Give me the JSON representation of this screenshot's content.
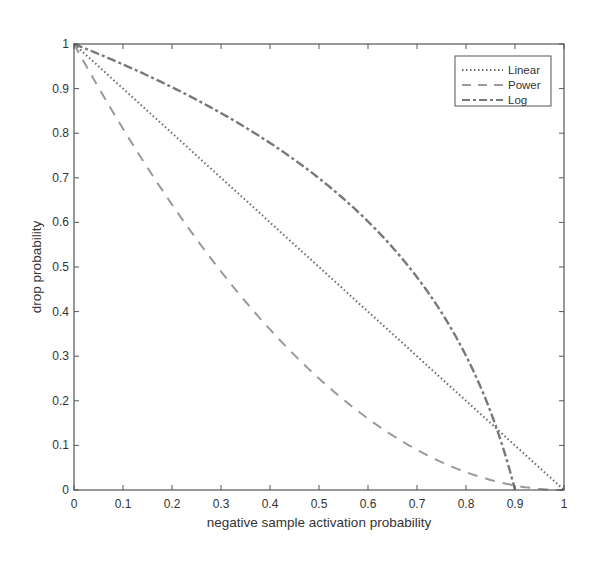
{
  "chart_data": {
    "type": "line",
    "title": "",
    "xlabel": "negative sample activation probability",
    "ylabel": "drop probability",
    "xlim": [
      0,
      1
    ],
    "ylim": [
      0,
      1
    ],
    "grid": false,
    "legend_position": "upper right",
    "xticks": [
      "0",
      "0.1",
      "0.2",
      "0.3",
      "0.4",
      "0.5",
      "0.6",
      "0.7",
      "0.8",
      "0.9",
      "1"
    ],
    "yticks": [
      "0",
      "0.1",
      "0.2",
      "0.3",
      "0.4",
      "0.5",
      "0.6",
      "0.7",
      "0.8",
      "0.9",
      "1"
    ],
    "x": [
      0,
      0.1,
      0.2,
      0.3,
      0.4,
      0.5,
      0.6,
      0.7,
      0.8,
      0.85,
      0.9,
      1.0
    ],
    "series": [
      {
        "name": "Linear",
        "style": "dotted",
        "color": "#6a6a6a",
        "values": [
          1.0,
          0.9,
          0.8,
          0.7,
          0.6,
          0.5,
          0.4,
          0.3,
          0.2,
          0.15,
          0.1,
          0.0
        ]
      },
      {
        "name": "Power",
        "style": "dashed",
        "color": "#9a9a9a",
        "values": [
          1.0,
          0.81,
          0.64,
          0.49,
          0.36,
          0.25,
          0.16,
          0.09,
          0.04,
          0.0225,
          0.01,
          0.0
        ]
      },
      {
        "name": "Log",
        "style": "dash-dot",
        "color": "#787878",
        "values": [
          1.0,
          0.954,
          0.903,
          0.845,
          0.778,
          0.699,
          0.602,
          0.477,
          0.301,
          0.176,
          0.0,
          null
        ]
      }
    ]
  }
}
